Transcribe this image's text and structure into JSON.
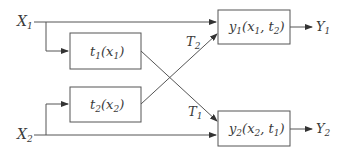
{
  "diagram": {
    "inputs": [
      {
        "id": "X1",
        "base": "X",
        "sub": "1"
      },
      {
        "id": "X2",
        "base": "X",
        "sub": "2"
      }
    ],
    "outputs": [
      {
        "id": "Y1",
        "base": "Y",
        "sub": "1"
      },
      {
        "id": "Y2",
        "base": "Y",
        "sub": "2"
      }
    ],
    "boxes": {
      "t1": {
        "fn": "t",
        "fn_sub": "1",
        "args": [
          {
            "b": "x",
            "s": "1"
          }
        ]
      },
      "t2": {
        "fn": "t",
        "fn_sub": "2",
        "args": [
          {
            "b": "x",
            "s": "2"
          }
        ]
      },
      "y1": {
        "fn": "y",
        "fn_sub": "1",
        "args": [
          {
            "b": "x",
            "s": "1"
          },
          {
            "b": "t",
            "s": "2"
          }
        ]
      },
      "y2": {
        "fn": "y",
        "fn_sub": "2",
        "args": [
          {
            "b": "x",
            "s": "2"
          },
          {
            "b": "t",
            "s": "1"
          }
        ]
      }
    },
    "edge_labels": [
      {
        "id": "T2",
        "base": "T",
        "sub": "2"
      },
      {
        "id": "T1",
        "base": "T",
        "sub": "1"
      }
    ],
    "paren_open": "(",
    "paren_close": ")",
    "comma": ", "
  }
}
